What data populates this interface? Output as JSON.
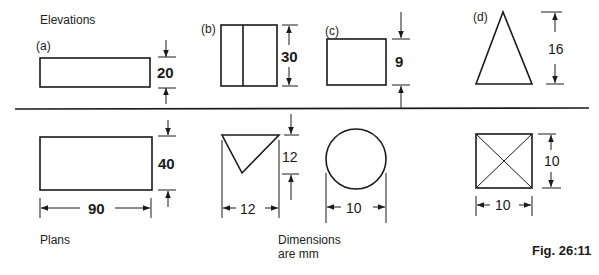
{
  "headings": {
    "elevations": "Elevations",
    "plans": "Plans",
    "note_line1": "Dimensions",
    "note_line2": "are mm",
    "figure": "Fig. 26:11"
  },
  "shapes": [
    {
      "label": "(a)",
      "elevation_dim": "20",
      "plan_height_dim": "40",
      "plan_width_dim": "90",
      "elevation": "rectangle",
      "plan": "rectangle"
    },
    {
      "label": "(b)",
      "elevation_dim": "30",
      "plan_height_dim": "12",
      "plan_width_dim": "12",
      "elevation": "rectangle-with-centre-line",
      "plan": "inverted-triangle"
    },
    {
      "label": "(c)",
      "elevation_dim": "9",
      "plan_width_dim": "10",
      "elevation": "rectangle",
      "plan": "circle"
    },
    {
      "label": "(d)",
      "elevation_dim": "16",
      "plan_height_dim": "10",
      "plan_width_dim": "10",
      "elevation": "triangle",
      "plan": "square-with-diagonals"
    }
  ],
  "colors": {
    "ink": "#1a1a1a",
    "background": "#ffffff"
  }
}
